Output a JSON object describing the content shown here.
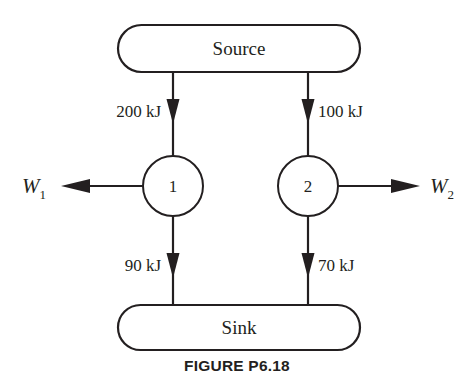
{
  "figure": {
    "caption": "FIGURE P6.18",
    "stroke_color": "#231f20",
    "background_color": "#ffffff"
  },
  "reservoirs": {
    "source": {
      "label": "Source",
      "shape": "rounded-rectangle"
    },
    "sink": {
      "label": "Sink",
      "shape": "rounded-rectangle"
    }
  },
  "engines": [
    {
      "label": "1",
      "shape": "circle"
    },
    {
      "label": "2",
      "shape": "circle"
    }
  ],
  "heat_flows": {
    "source_to_engine1": {
      "label": "200 kJ",
      "direction": "down",
      "label_side": "left"
    },
    "source_to_engine2": {
      "label": "100 kJ",
      "direction": "down",
      "label_side": "right"
    },
    "engine1_to_sink": {
      "label": "90 kJ",
      "direction": "down",
      "label_side": "left"
    },
    "engine2_to_sink": {
      "label": "70 kJ",
      "direction": "down",
      "label_side": "right"
    }
  },
  "work_outputs": {
    "w1": {
      "symbol": "W",
      "subscript": "1",
      "direction": "left"
    },
    "w2": {
      "symbol": "W",
      "subscript": "2",
      "direction": "right"
    }
  }
}
